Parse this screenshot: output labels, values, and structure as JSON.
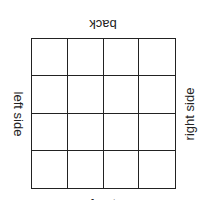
{
  "diagram": {
    "rows": 4,
    "cols": 4,
    "labels": {
      "top": "back",
      "left": "left side",
      "right": "right side",
      "bottom": "front"
    }
  }
}
